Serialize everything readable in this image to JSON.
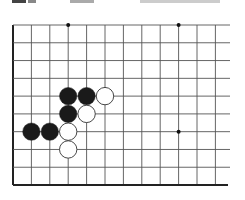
{
  "board": {
    "grid": {
      "cols": 12,
      "rows": 10,
      "origin_x": 13,
      "origin_y": 25,
      "col_spacing": 18.4,
      "row_spacing": 17.78,
      "line_extend_right": 230,
      "line_color": "#555555",
      "border_color": "#222222"
    },
    "star_points": [
      {
        "col": 3,
        "row": 0
      },
      {
        "col": 9,
        "row": 0
      },
      {
        "col": 9,
        "row": 6
      }
    ],
    "stones": [
      {
        "color": "black",
        "col": 3,
        "row": 4
      },
      {
        "color": "black",
        "col": 4,
        "row": 4
      },
      {
        "color": "white",
        "col": 5,
        "row": 4
      },
      {
        "color": "black",
        "col": 3,
        "row": 5
      },
      {
        "color": "white",
        "col": 4,
        "row": 5
      },
      {
        "color": "black",
        "col": 1,
        "row": 6
      },
      {
        "color": "black",
        "col": 2,
        "row": 6
      },
      {
        "color": "white",
        "col": 3,
        "row": 6
      },
      {
        "color": "white",
        "col": 3,
        "row": 7
      }
    ],
    "colors": {
      "black_stone": "#1a1a1a",
      "white_stone": "#ffffff",
      "white_stone_outline": "#333333",
      "star": "#111111"
    }
  }
}
